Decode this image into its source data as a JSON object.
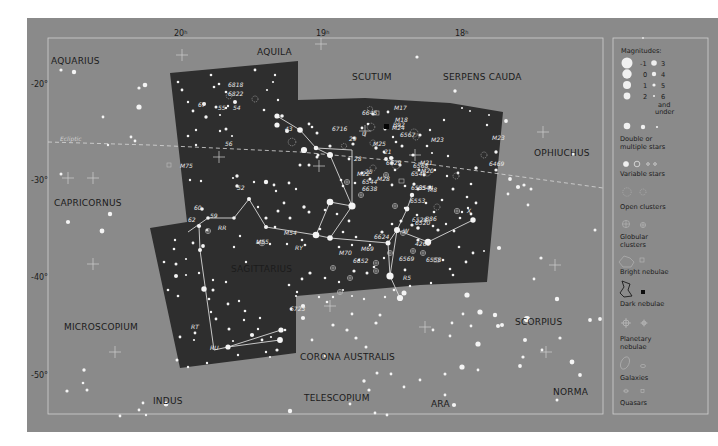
{
  "map": {
    "title": "Sagittarius star chart",
    "colors": {
      "background": "#8a8a8a",
      "constellation_area": "#2d2d2d",
      "frame": "#d8d8d8",
      "star": "#f4f4f4",
      "text_dark": "#1b1b1b",
      "text_light": "#e8e8e8"
    },
    "ra_labels": [
      {
        "hours": "20",
        "suffix": "h"
      },
      {
        "hours": "19",
        "suffix": "h"
      },
      {
        "hours": "18",
        "suffix": "h"
      }
    ],
    "dec_labels": [
      "-20°",
      "-30°",
      "-40°",
      "-50°"
    ],
    "ecliptic_label": "Ecliptic",
    "constellations": [
      {
        "id": "aquarius",
        "name": "AQUARIUS"
      },
      {
        "id": "aquila",
        "name": "AQUILA"
      },
      {
        "id": "scutum",
        "name": "SCUTUM"
      },
      {
        "id": "serpens-cauda",
        "name": "SERPENS CAUDA"
      },
      {
        "id": "ophiuchus",
        "name": "OPHIUCHUS"
      },
      {
        "id": "capricornus",
        "name": "CAPRICORNUS"
      },
      {
        "id": "sagittarius",
        "name": "SAGITTARIUS"
      },
      {
        "id": "microscopium",
        "name": "MICROSCOPIUM"
      },
      {
        "id": "scorpius",
        "name": "SCORPIUS"
      },
      {
        "id": "corona-australis",
        "name": "CORONA AUSTRALIS"
      },
      {
        "id": "indus",
        "name": "INDUS"
      },
      {
        "id": "telescopium",
        "name": "TELESCOPIUM"
      },
      {
        "id": "ara",
        "name": "ARA"
      },
      {
        "id": "norma",
        "name": "NORMA"
      }
    ],
    "object_labels": [
      "6818",
      "6822",
      "55",
      "54",
      "67",
      "56",
      "43",
      "M75",
      "52",
      "60",
      "59",
      "62",
      "6645",
      "M17",
      "M18",
      "M24",
      "B92",
      "6567",
      "M23",
      "6716",
      "29",
      "U",
      "M25",
      "21",
      "28",
      "6629",
      "6568",
      "M21",
      "M20",
      "6469",
      "M22",
      "25",
      "6544",
      "M28",
      "6546",
      "6638",
      "6544",
      "6535",
      "M8",
      "6553",
      "6528",
      "6520",
      "B86",
      "X",
      "W",
      "6624",
      "4265",
      "M54",
      "M55",
      "RR",
      "RY",
      "M70",
      "M69",
      "6652",
      "6569",
      "6558",
      "R5",
      "6723",
      "RT",
      "RU"
    ]
  },
  "legend": {
    "title": "Magnitudes:",
    "magnitudes_left": [
      "-1",
      "0",
      "1",
      "2"
    ],
    "magnitudes_right": [
      "3",
      "4",
      "5",
      "6"
    ],
    "and_under": [
      "and",
      "under"
    ],
    "items": [
      {
        "id": "double-stars",
        "lines": [
          "Double or",
          "multiple stars"
        ]
      },
      {
        "id": "variable-stars",
        "lines": [
          "Variable stars"
        ]
      },
      {
        "id": "open-clusters",
        "lines": [
          "Open clusters"
        ]
      },
      {
        "id": "globular-clusters",
        "lines": [
          "Globular",
          "clusters"
        ]
      },
      {
        "id": "bright-nebulae",
        "lines": [
          "Bright nebulae"
        ]
      },
      {
        "id": "dark-nebulae",
        "lines": [
          "Dark nebulae"
        ]
      },
      {
        "id": "planetary-nebulae",
        "lines": [
          "Planetary",
          "nebulae"
        ]
      },
      {
        "id": "galaxies",
        "lines": [
          "Galaxies"
        ]
      },
      {
        "id": "quasars",
        "lines": [
          "Quasars"
        ]
      }
    ]
  }
}
